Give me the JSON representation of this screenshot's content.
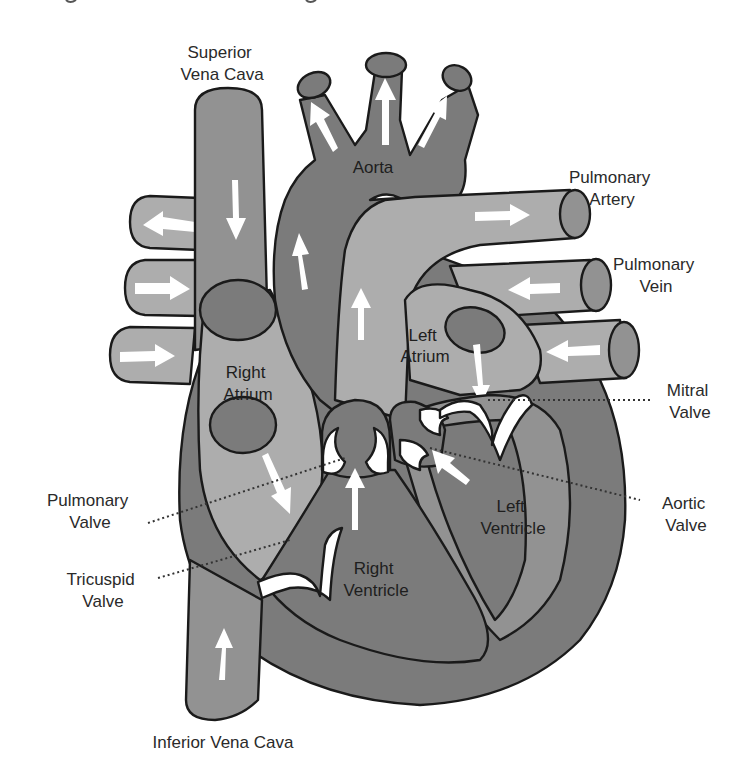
{
  "figure": {
    "colors": {
      "outline": "#1a1a1a",
      "deoxygenated_vessel": "#929292",
      "chamber_wall": "#7b7b7b",
      "pulmonary_vessel": "#adadad",
      "valve_and_arrow": "#ffffff",
      "label_text": "#2a2a2a"
    }
  },
  "labels": {
    "superior_vena_cava": {
      "line1": "Superior",
      "line2": "Vena Cava"
    },
    "aorta": {
      "line1": "Aorta"
    },
    "pulmonary_artery": {
      "line1": "Pulmonary",
      "line2": "Artery"
    },
    "pulmonary_vein": {
      "line1": "Pulmonary",
      "line2": "Vein"
    },
    "left_atrium": {
      "line1": "Left",
      "line2": "Atrium"
    },
    "right_atrium": {
      "line1": "Right",
      "line2": "Atrium"
    },
    "mitral_valve": {
      "line1": "Mitral",
      "line2": "Valve"
    },
    "aortic_valve": {
      "line1": "Aortic",
      "line2": "Valve"
    },
    "pulmonary_valve": {
      "line1": "Pulmonary",
      "line2": "Valve"
    },
    "tricuspid_valve": {
      "line1": "Tricuspid",
      "line2": "Valve"
    },
    "left_ventricle": {
      "line1": "Left",
      "line2": "Ventricle"
    },
    "right_ventricle": {
      "line1": "Right",
      "line2": "Ventricle"
    },
    "inferior_vena_cava": {
      "line1": "Inferior Vena Cava"
    }
  },
  "icons": {
    "flow_arrow": "blood-flow-arrow",
    "leader_line": "dotted-leader-line"
  }
}
